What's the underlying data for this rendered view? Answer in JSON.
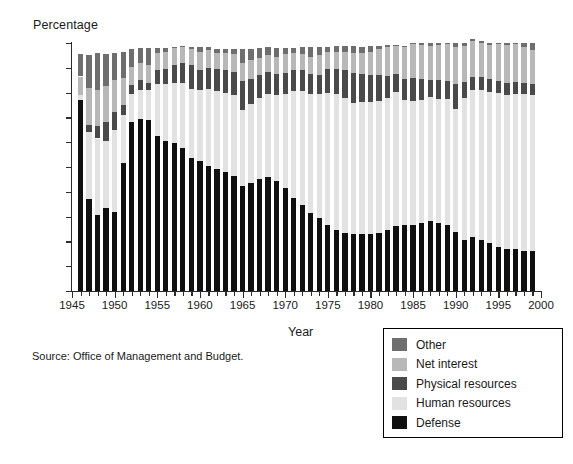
{
  "chart_data": {
    "type": "bar",
    "subtype": "stacked-percentage",
    "title": "",
    "xlabel": "Year",
    "ylabel": "Percentage",
    "ylim": [
      0,
      100
    ],
    "ytick_labels": [
      "0%",
      "10%",
      "20%",
      "30%",
      "40%",
      "50%",
      "60%",
      "70%",
      "80%",
      "90%",
      "100%"
    ],
    "ytick_values": [
      0,
      10,
      20,
      30,
      40,
      50,
      60,
      70,
      80,
      90,
      100
    ],
    "xlim": [
      1945,
      2000
    ],
    "xtick_labels": [
      "1945",
      "1950",
      "1955",
      "1960",
      "1965",
      "1970",
      "1975",
      "1980",
      "1985",
      "1990",
      "1995",
      "2000"
    ],
    "xtick_values": [
      1945,
      1950,
      1955,
      1960,
      1965,
      1970,
      1975,
      1980,
      1985,
      1990,
      1995,
      2000
    ],
    "grid": false,
    "legend_position": "bottom-right",
    "source": "Source:  Office of Management and Budget.",
    "x": [
      1946,
      1947,
      1948,
      1949,
      1950,
      1951,
      1952,
      1953,
      1954,
      1955,
      1956,
      1957,
      1958,
      1959,
      1960,
      1961,
      1962,
      1963,
      1964,
      1965,
      1966,
      1967,
      1968,
      1969,
      1970,
      1971,
      1972,
      1973,
      1974,
      1975,
      1976,
      1977,
      1978,
      1979,
      1980,
      1981,
      1982,
      1983,
      1984,
      1985,
      1986,
      1987,
      1988,
      1989,
      1990,
      1991,
      1992,
      1993,
      1994,
      1995,
      1996,
      1997,
      1998,
      1999
    ],
    "series": [
      {
        "name": "Defense",
        "color": "#101010",
        "values": [
          77,
          37,
          30.5,
          33.5,
          32,
          51.5,
          68,
          69.5,
          69,
          62.5,
          60.5,
          59.5,
          57.5,
          53.5,
          52.5,
          50.5,
          49,
          48,
          46.5,
          42.5,
          43.5,
          45,
          46,
          44.5,
          41.5,
          37.5,
          34.5,
          31.5,
          29.5,
          26.5,
          24.5,
          23.5,
          22.8,
          23.1,
          22.8,
          23.2,
          24.8,
          26.1,
          26.7,
          26.7,
          27.6,
          28.1,
          27.3,
          26.6,
          23.9,
          20.6,
          21.6,
          20.7,
          19.3,
          17.9,
          17,
          16.9,
          16.2,
          16.1
        ]
      },
      {
        "name": "Human resources",
        "color": "#e2e2e2",
        "values": [
          2,
          27,
          31,
          27,
          33,
          19.5,
          11.5,
          11.5,
          12,
          21,
          23,
          24.5,
          26.5,
          28,
          28.5,
          31,
          31.5,
          32,
          32.5,
          30.5,
          32,
          33,
          33.5,
          34.5,
          38,
          43,
          46,
          48,
          50,
          53.5,
          55,
          54.5,
          53,
          53,
          53.5,
          53.6,
          53,
          54,
          50.4,
          50.1,
          49.3,
          50,
          50.2,
          50.8,
          49.5,
          57.1,
          59.6,
          60.4,
          61,
          61.9,
          62.2,
          62.6,
          63.2,
          62.9
        ]
      },
      {
        "name": "Physical resources",
        "color": "#4a4a4a",
        "values": [
          0,
          3,
          5,
          7.5,
          7,
          4,
          3.5,
          4,
          3,
          5.5,
          6,
          7,
          8,
          9.5,
          8,
          8.5,
          9,
          9,
          9.5,
          11.5,
          10,
          9,
          9,
          8.5,
          8.5,
          8.5,
          8.5,
          8,
          7.5,
          9.5,
          10,
          11,
          12,
          11.5,
          11,
          10.5,
          9,
          7.5,
          8.5,
          9,
          8.5,
          7,
          7.5,
          7.3,
          10.2,
          6.5,
          5.2,
          5,
          5,
          4.8,
          4.6,
          4.8,
          4.4,
          4.6
        ]
      },
      {
        "name": "Net interest",
        "color": "#b8b8b8",
        "values": [
          7.5,
          15,
          14.5,
          14.5,
          13,
          11,
          7.5,
          7,
          7,
          7,
          7,
          7,
          6.5,
          6.5,
          7.5,
          7,
          6.5,
          7,
          7,
          7.5,
          7.5,
          7,
          6.5,
          7,
          7.5,
          7,
          6.5,
          7,
          8,
          7,
          7,
          7.5,
          8,
          8.5,
          9,
          10.1,
          11.4,
          11.1,
          13,
          13.7,
          13.7,
          13.8,
          14.3,
          14.8,
          14.8,
          14.7,
          14.4,
          14.1,
          13.9,
          15.3,
          15.5,
          15.2,
          14.6,
          13.5
        ]
      },
      {
        "name": "Other",
        "color": "#6e6e6e",
        "values": [
          9,
          13,
          15,
          13,
          11,
          10.5,
          7,
          6,
          7,
          2,
          1.5,
          0.5,
          0.5,
          1,
          2,
          1.5,
          1.5,
          1.5,
          2,
          5.5,
          4.5,
          4,
          3.5,
          3.5,
          2.5,
          2,
          3,
          4,
          3.5,
          2,
          2.5,
          2.5,
          3,
          2.5,
          2.5,
          1.5,
          1,
          0.5,
          0.4,
          0.5,
          0.9,
          1.1,
          0.7,
          0.5,
          1.6,
          1.1,
          1,
          0.8,
          0.8,
          0.1,
          0.7,
          0.5,
          1.6,
          2.9
        ]
      }
    ]
  },
  "legend": {
    "items": [
      {
        "label": "Other",
        "color": "#6e6e6e"
      },
      {
        "label": "Net interest",
        "color": "#b8b8b8"
      },
      {
        "label": "Physical resources",
        "color": "#4a4a4a"
      },
      {
        "label": "Human resources",
        "color": "#e2e2e2"
      },
      {
        "label": "Defense",
        "color": "#101010"
      }
    ]
  }
}
